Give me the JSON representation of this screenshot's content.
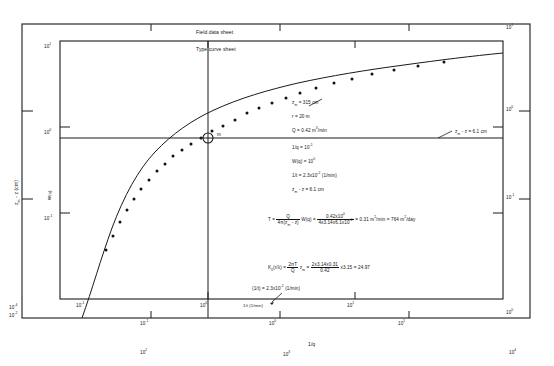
{
  "figure": {
    "sheet_labels": {
      "field": "Field data sheet",
      "type_curve": "Type curve sheet"
    },
    "match_point_marker": "m"
  },
  "axes": {
    "field": {
      "x_label": "1/t (1/min)",
      "x_ticks": [
        "10<sup>-2</sup>",
        "10<sup>-1</sup>",
        "10<sup>0</sup>",
        "10<sup>1</sup>",
        "10<sup>2</sup>",
        "10<sup>3</sup>",
        "10<sup>4</sup>"
      ],
      "y_label": "z<sub>m</sub> - z (cm)",
      "y_ticks": [
        "10<sup>1</sup>",
        "10<sup>0</sup>",
        "10<sup>-1</sup>",
        "10<sup>-4</sup>"
      ]
    },
    "type_curve": {
      "x_label": "1/q",
      "x_ticks": [
        "10<sup>-1</sup>",
        "10<sup>0</sup>",
        "10<sup>1</sup>"
      ],
      "y_label": "W(q)",
      "y_ticks": [
        "10<sup>1</sup>",
        "10<sup>0</sup>",
        "10<sup>-1</sup>"
      ],
      "y_ticks_right": [
        "10<sup>1</sup>",
        "10<sup>0</sup>",
        "10<sup>-1</sup>",
        "10<sup>0</sup>"
      ]
    }
  },
  "annotations": {
    "params": [
      "z<sub>m</sub> = 315 cm",
      "r = 20 m",
      "Q = 0.42 m<sup>3</sup>/min"
    ],
    "match_values": [
      "1/q = 10<sup>-1</sup>",
      "W(q) = 10<sup>0</sup>",
      "1/t = 2.3x10<sup>-2</sup> (1/min)",
      "z<sub>m</sub> - z = 6.1 cm"
    ],
    "match_line_label": "z<sub>m</sub> - z = 6.1 cm",
    "bottom_match_label": "(1/t) = 2.3x10<sup>-2</sup> (1/min)",
    "transmissivity": {
      "lhs": "T =",
      "frac1_num": "Q",
      "frac1_den": "4&#960;(z<sub>m</sub> - z)",
      "mult": "W(q)",
      "eq1": "=",
      "frac2_num": "0.42x10<sup>0</sup>",
      "frac2_den": "4x3.14x6.1x10<sup>-2</sup>",
      "eq2": "=",
      "result1": "0.31 m<sup>2</sup>/min",
      "eq3": "=",
      "result2": "764 m<sup>2</sup>/day"
    },
    "bessel": {
      "lhs": "K<sub>0</sub>(r/&#955;) =",
      "frac1_num": "2&#960;T",
      "frac1_den": "Q",
      "mult": "z<sub>m</sub>",
      "eq1": "=",
      "frac2_num": "2x3.14x0.31",
      "frac2_den": "0.42",
      "mult2": "x3.15",
      "eq2": "=",
      "result": "24.97"
    }
  },
  "chart_data": {
    "type": "line",
    "xlabel": "1/q",
    "ylabel": "W(q)",
    "xlim_log": [
      -1,
      1
    ],
    "ylim_log": [
      -1,
      1
    ],
    "grid": false,
    "legend": "none",
    "series": [
      {
        "name": "Theis type curve W(q)",
        "x_log": [
          -0.95,
          -0.85,
          -0.75,
          -0.65,
          -0.55,
          -0.45,
          -0.35,
          -0.25,
          -0.15,
          -0.05,
          0.05,
          0.15,
          0.25,
          0.35,
          0.45,
          0.55,
          0.65,
          0.75,
          0.85,
          0.95
        ],
        "y_log": [
          -1.3,
          -1.02,
          -0.8,
          -0.62,
          -0.47,
          -0.35,
          -0.25,
          -0.16,
          -0.09,
          -0.02,
          0.04,
          0.09,
          0.14,
          0.18,
          0.22,
          0.26,
          0.29,
          0.32,
          0.35,
          0.38
        ]
      },
      {
        "name": "Field data points",
        "x_log": [
          -0.72,
          -0.66,
          -0.6,
          -0.55,
          -0.5,
          -0.45,
          -0.4,
          -0.35,
          -0.3,
          -0.26,
          -0.22,
          -0.18,
          -0.14,
          -0.1,
          -0.06,
          -0.02,
          0.04,
          0.1,
          0.17,
          0.24,
          0.31,
          0.38,
          0.46,
          0.54
        ],
        "y_log": [
          -0.8,
          -0.66,
          -0.54,
          -0.45,
          -0.38,
          -0.31,
          -0.25,
          -0.2,
          -0.15,
          -0.11,
          -0.07,
          -0.04,
          -0.01,
          0.02,
          0.05,
          0.07,
          0.1,
          0.13,
          0.17,
          0.21,
          0.25,
          0.28,
          0.31,
          0.34
        ]
      }
    ],
    "match_point": {
      "label": "m",
      "one_over_q": 0.1,
      "W_q": 1.0,
      "one_over_t": 0.023,
      "drawdown_cm": 6.1
    }
  }
}
